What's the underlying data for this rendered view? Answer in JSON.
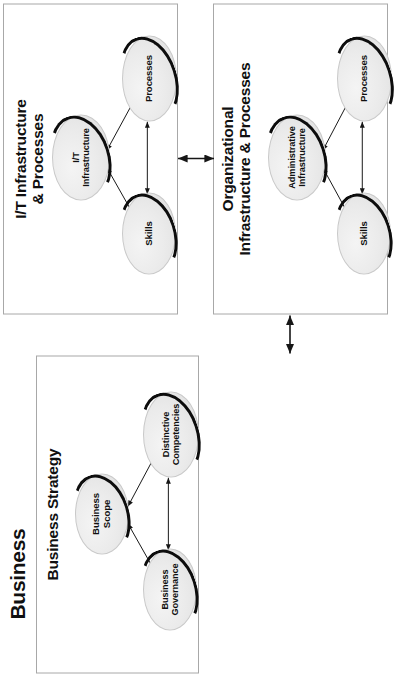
{
  "diagram": {
    "domains": [
      {
        "id": "business",
        "label": "Business"
      }
    ],
    "quadrants": [
      {
        "id": "business-strategy",
        "title": "Business Strategy",
        "nodes": [
          {
            "id": "business-scope",
            "label": "Business\nScope"
          },
          {
            "id": "business-governance",
            "label": "Business\nGovernance"
          },
          {
            "id": "distinctive-competencies",
            "label": "Distinctive\nCompetencies"
          }
        ]
      },
      {
        "id": "it-infrastructure-processes",
        "title": "I/T Infrastructure\n& Processes",
        "nodes": [
          {
            "id": "it-infrastructure",
            "label": "I/T\nInfrastructure"
          },
          {
            "id": "it-skills",
            "label": "Skills"
          },
          {
            "id": "it-processes",
            "label": "Processes"
          }
        ]
      },
      {
        "id": "organizational-infrastructure-processes",
        "title": "Organizational\nInfrastructure & Processes",
        "nodes": [
          {
            "id": "administrative-infrastructure",
            "label": "Administrative\nInfrastructure"
          },
          {
            "id": "org-skills",
            "label": "Skills"
          },
          {
            "id": "org-processes",
            "label": "Processes"
          }
        ]
      }
    ],
    "connectors": {
      "strategic_fit_label": "",
      "functional_integration_label": ""
    },
    "colors": {
      "node_fill": "#ebebeb",
      "node_shadow": "#0d0d0d",
      "box_border": "#a8a8a8",
      "text": "#101010",
      "background": "#ffffff"
    }
  }
}
